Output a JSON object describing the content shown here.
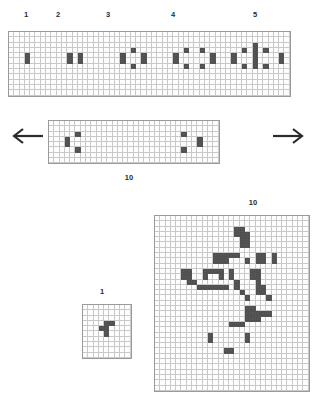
{
  "figure": {
    "title_visible": false,
    "colors": {
      "cell_on": "#555555",
      "grid_line": "#c9c9c9",
      "grid_border": "#9a9a9a",
      "background": "#ffffff",
      "label_text": "#2b2b2b",
      "arrow": "#2b2b2b"
    }
  },
  "top_band": {
    "labels": [
      {
        "text": "1"
      },
      {
        "text": "2"
      },
      {
        "text": "3"
      },
      {
        "text": "4"
      },
      {
        "text": "5"
      }
    ],
    "grid": {
      "cols": 53,
      "rows": 12,
      "on_cells": [
        [
          4,
          3
        ],
        [
          5,
          3
        ],
        [
          4,
          11
        ],
        [
          5,
          11
        ],
        [
          4,
          13
        ],
        [
          5,
          13
        ],
        [
          3,
          23
        ],
        [
          4,
          21
        ],
        [
          5,
          21
        ],
        [
          4,
          25
        ],
        [
          5,
          25
        ],
        [
          6,
          23
        ],
        [
          3,
          33
        ],
        [
          3,
          36
        ],
        [
          4,
          31
        ],
        [
          5,
          31
        ],
        [
          4,
          38
        ],
        [
          5,
          38
        ],
        [
          6,
          33
        ],
        [
          6,
          36
        ],
        [
          2,
          46
        ],
        [
          3,
          44
        ],
        [
          3,
          48
        ],
        [
          4,
          42
        ],
        [
          5,
          42
        ],
        [
          4,
          46
        ],
        [
          5,
          46
        ],
        [
          3,
          46
        ],
        [
          6,
          46
        ],
        [
          4,
          51
        ],
        [
          5,
          51
        ],
        [
          6,
          44
        ],
        [
          6,
          48
        ]
      ]
    }
  },
  "middle_band": {
    "label": "10",
    "arrow_left": "arrow-left",
    "arrow_right": "arrow-right",
    "grid": {
      "cols": 32,
      "rows": 8,
      "on_cells": [
        [
          2,
          5
        ],
        [
          3,
          3
        ],
        [
          4,
          3
        ],
        [
          5,
          5
        ],
        [
          2,
          25
        ],
        [
          3,
          28
        ],
        [
          4,
          28
        ],
        [
          5,
          25
        ]
      ]
    }
  },
  "bottom_left": {
    "label": "1",
    "grid": {
      "cols": 9,
      "rows": 10,
      "on_cells": [
        [
          3,
          4
        ],
        [
          3,
          5
        ],
        [
          4,
          3
        ],
        [
          4,
          4
        ],
        [
          5,
          4
        ]
      ]
    }
  },
  "bottom_right": {
    "label": "10",
    "grid": {
      "cols": 29,
      "rows": 33,
      "on_cells": [
        [
          2,
          15
        ],
        [
          2,
          16
        ],
        [
          3,
          15
        ],
        [
          3,
          16
        ],
        [
          3,
          17
        ],
        [
          4,
          16
        ],
        [
          4,
          17
        ],
        [
          5,
          16
        ],
        [
          5,
          17
        ],
        [
          7,
          11
        ],
        [
          7,
          12
        ],
        [
          7,
          13
        ],
        [
          7,
          14
        ],
        [
          7,
          15
        ],
        [
          7,
          19
        ],
        [
          7,
          20
        ],
        [
          7,
          22
        ],
        [
          8,
          11
        ],
        [
          8,
          12
        ],
        [
          8,
          13
        ],
        [
          8,
          17
        ],
        [
          8,
          19
        ],
        [
          8,
          20
        ],
        [
          8,
          22
        ],
        [
          10,
          5
        ],
        [
          10,
          6
        ],
        [
          10,
          9
        ],
        [
          10,
          10
        ],
        [
          10,
          11
        ],
        [
          10,
          12
        ],
        [
          10,
          14
        ],
        [
          10,
          18
        ],
        [
          10,
          19
        ],
        [
          11,
          5
        ],
        [
          11,
          6
        ],
        [
          11,
          9
        ],
        [
          11,
          12
        ],
        [
          11,
          14
        ],
        [
          11,
          18
        ],
        [
          11,
          19
        ],
        [
          12,
          6
        ],
        [
          12,
          7
        ],
        [
          12,
          15
        ],
        [
          12,
          19
        ],
        [
          13,
          8
        ],
        [
          13,
          9
        ],
        [
          13,
          10
        ],
        [
          13,
          11
        ],
        [
          13,
          12
        ],
        [
          13,
          13
        ],
        [
          13,
          15
        ],
        [
          13,
          19
        ],
        [
          13,
          20
        ],
        [
          14,
          16
        ],
        [
          14,
          19
        ],
        [
          14,
          20
        ],
        [
          15,
          17
        ],
        [
          15,
          21
        ],
        [
          17,
          17
        ],
        [
          17,
          18
        ],
        [
          18,
          17
        ],
        [
          18,
          18
        ],
        [
          18,
          19
        ],
        [
          18,
          20
        ],
        [
          18,
          21
        ],
        [
          19,
          17
        ],
        [
          19,
          18
        ],
        [
          19,
          19
        ],
        [
          20,
          14
        ],
        [
          20,
          15
        ],
        [
          20,
          16
        ],
        [
          22,
          10
        ],
        [
          22,
          17
        ],
        [
          23,
          10
        ],
        [
          23,
          17
        ],
        [
          25,
          13
        ],
        [
          25,
          14
        ]
      ]
    }
  }
}
